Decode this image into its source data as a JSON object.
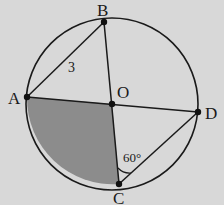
{
  "diagram": {
    "colors": {
      "background": "#d8d8d8",
      "stroke": "#1a1a1a",
      "shaded_region": "#8c8c8c"
    },
    "circle": {
      "center_label": "O",
      "cx": 112,
      "cy": 104,
      "r": 86
    },
    "points": [
      {
        "label": "A",
        "x": 27,
        "y": 97
      },
      {
        "label": "B",
        "x": 104,
        "y": 22
      },
      {
        "label": "O",
        "x": 112,
        "y": 104
      },
      {
        "label": "C",
        "x": 119,
        "y": 184
      },
      {
        "label": "D",
        "x": 198,
        "y": 112
      }
    ],
    "segments": [
      "AB",
      "BC",
      "AD",
      "CD"
    ],
    "shaded": "sector AOC",
    "annotations": {
      "ab_length": "3",
      "angle_ocd": "60°"
    }
  }
}
